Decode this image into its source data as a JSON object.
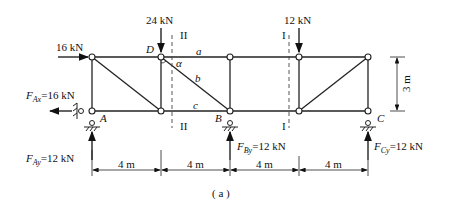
{
  "figure": {
    "caption": "( a )",
    "loads": {
      "horizontal_D_left": "16 kN",
      "vertical_D": "24 kN",
      "vertical_4th": "12 kN"
    },
    "reactions": {
      "FAx": {
        "symbol": "F",
        "sub": "Ax",
        "value": "=16 kN"
      },
      "FAy": {
        "symbol": "F",
        "sub": "Ay",
        "value": "=12 kN"
      },
      "FBy": {
        "symbol": "F",
        "sub": "By",
        "value": "=12 kN"
      },
      "FCy": {
        "symbol": "F",
        "sub": "Cy",
        "value": "=12 kN"
      }
    },
    "nodes": {
      "A": "A",
      "B": "B",
      "C": "C",
      "D": "D"
    },
    "members": {
      "a": "a",
      "b": "b",
      "c": "c",
      "alpha": "α"
    },
    "sections": {
      "II": "II",
      "I": "I"
    },
    "dimensions": {
      "span1": "4 m",
      "span2": "4 m",
      "span3": "4 m",
      "span4": "4 m",
      "height": "3 m"
    }
  }
}
